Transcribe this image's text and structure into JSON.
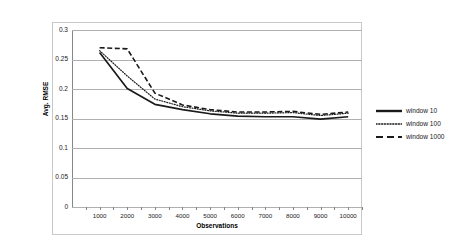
{
  "chart_data": {
    "type": "line",
    "title": "",
    "xlabel": "Observations",
    "ylabel": "Avg. RMSE",
    "xlim": [
      0,
      10500
    ],
    "ylim": [
      0,
      0.3
    ],
    "grid": true,
    "legend_position": "right",
    "x": [
      1000,
      2000,
      3000,
      4000,
      5000,
      6000,
      7000,
      8000,
      9000,
      10000
    ],
    "xticks": [
      "1000",
      "2000",
      "3000",
      "4000",
      "5000",
      "6000",
      "7000",
      "8000",
      "9000",
      "10000"
    ],
    "yticks": [
      "0",
      "0.05",
      "0.1",
      "0.15",
      "0.2",
      "0.25",
      "0.3"
    ],
    "ytick_values": [
      0,
      0.05,
      0.1,
      0.15,
      0.2,
      0.25,
      0.3
    ],
    "series": [
      {
        "name": "window 10",
        "style": "solid",
        "color": "#1a1a1a",
        "values": [
          0.262,
          0.201,
          0.174,
          0.165,
          0.158,
          0.154,
          0.153,
          0.153,
          0.149,
          0.153
        ]
      },
      {
        "name": "window 100",
        "style": "dotted",
        "color": "#1a1a1a",
        "values": [
          0.265,
          0.222,
          0.183,
          0.17,
          0.163,
          0.159,
          0.159,
          0.16,
          0.155,
          0.159
        ]
      },
      {
        "name": "window 1000",
        "style": "dashed",
        "color": "#1a1a1a",
        "values": [
          0.27,
          0.268,
          0.193,
          0.173,
          0.165,
          0.161,
          0.161,
          0.162,
          0.157,
          0.161
        ]
      }
    ]
  },
  "legend": {
    "items": [
      {
        "label": "window 10"
      },
      {
        "label": "window 100"
      },
      {
        "label": "window 1000"
      }
    ]
  }
}
